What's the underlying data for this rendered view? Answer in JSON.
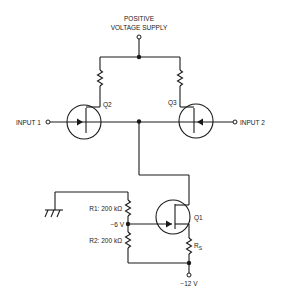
{
  "diagram": {
    "supply": {
      "line1": "POSITIVE",
      "line2": "VOLTAGE SUPPLY"
    },
    "inputs": {
      "input1": "INPUT 1",
      "input2": "INPUT 2"
    },
    "transistors": {
      "q1": "Q1",
      "q2": "Q2",
      "q3": "Q3"
    },
    "resistors": {
      "r1": "R1: 200 kΩ",
      "r2": "R2: 200 kΩ",
      "rs_main": "R",
      "rs_sub": "S"
    },
    "voltages": {
      "mid": "−6 V",
      "negative_supply": "−12 V"
    },
    "symbols": [
      "ground-icon",
      "jfet-n-channel-icon",
      "resistor-icon",
      "junction-dot",
      "terminal-open-circle"
    ],
    "colors": {
      "ink": "#1a1a1a",
      "background": "#ffffff"
    }
  }
}
